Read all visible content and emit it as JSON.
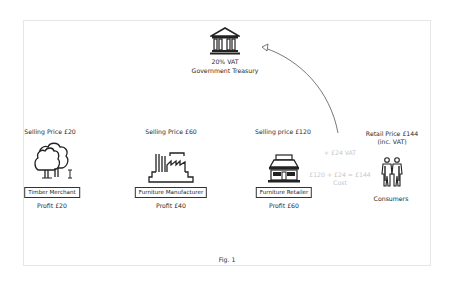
{
  "figure": {
    "caption": "Fig. 1",
    "accent_color": "#222222",
    "faint_text_color": "#c8c8c8",
    "arrow_color": "#555555"
  },
  "treasury": {
    "icon": "government-building-icon",
    "vat_rate": "20% VAT",
    "label": "Government Treasury"
  },
  "chain": [
    {
      "id": "timber-merchant",
      "icon": "tree-icon",
      "selling_price": "Selling Price £20",
      "label": "Timber Merchant",
      "profit": "Profit £20"
    },
    {
      "id": "furniture-manufacturer",
      "icon": "factory-icon",
      "selling_price": "Selling Price £60",
      "label": "Furniture Manufacturer",
      "profit": "Profit £40"
    },
    {
      "id": "furniture-retailer",
      "icon": "shop-icon",
      "selling_price": "Selling price £120",
      "label": "Furniture Retailer",
      "profit": "Profit £60"
    }
  ],
  "consumers": {
    "icon": "people-icon",
    "retail_price_line1": "Retail Price £144",
    "retail_price_line2": "(inc. VAT)",
    "label": "Consumers"
  },
  "vat_flow": {
    "vat_note": "+ £24 VAT",
    "cost_equation": "£120 + £24 = £144",
    "cost_label": "Cost"
  }
}
